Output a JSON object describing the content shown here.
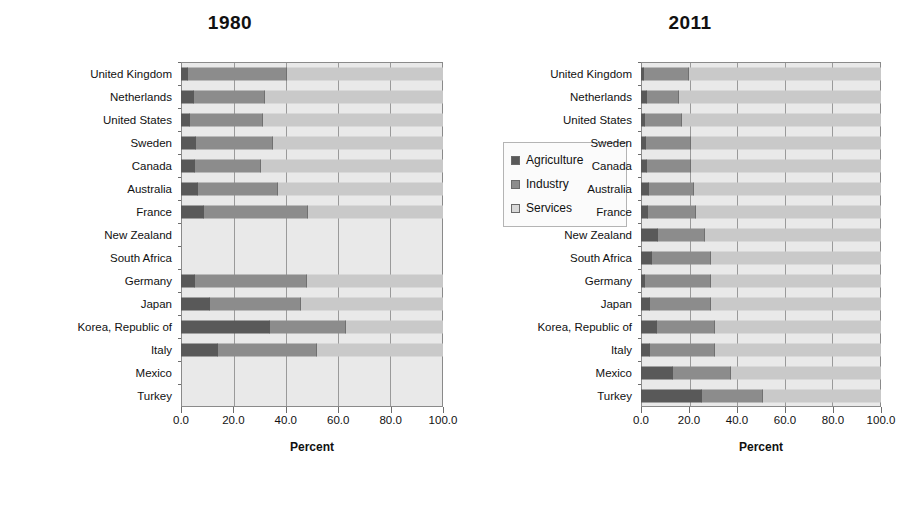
{
  "chart_data": [
    {
      "type": "bar",
      "orientation": "horizontal",
      "stacked": true,
      "percent_stacked": true,
      "title": "1980",
      "xlabel": "Percent",
      "ylabel": "",
      "xlim": [
        0,
        100
      ],
      "xticks": [
        "0.0",
        "20.0",
        "40.0",
        "60.0",
        "80.0",
        "100.0"
      ],
      "grid": true,
      "legend_position": "upper right inside plot",
      "legend": [
        "Agriculture",
        "Industry",
        "Services"
      ],
      "categories": [
        "United Kingdom",
        "Netherlands",
        "United States",
        "Sweden",
        "Canada",
        "Australia",
        "France",
        "New Zealand",
        "South Africa",
        "Germany",
        "Japan",
        "Korea, Republic of",
        "Italy",
        "Mexico",
        "Turkey"
      ],
      "series": [
        {
          "name": "Agriculture",
          "values": [
            2.6,
            5.1,
            3.4,
            5.6,
            5.4,
            6.5,
            8.6,
            null,
            null,
            5.2,
            10.9,
            34.0,
            14.2,
            null,
            null
          ]
        },
        {
          "name": "Industry",
          "values": [
            38.0,
            26.8,
            28.0,
            29.6,
            25.1,
            30.7,
            40.0,
            null,
            null,
            43.0,
            35.0,
            29.0,
            37.6,
            null,
            null
          ]
        },
        {
          "name": "Services",
          "values": [
            59.4,
            68.1,
            68.6,
            64.8,
            69.5,
            62.8,
            51.4,
            null,
            null,
            51.8,
            54.1,
            37.0,
            48.2,
            null,
            null
          ]
        }
      ]
    },
    {
      "type": "bar",
      "orientation": "horizontal",
      "stacked": true,
      "percent_stacked": true,
      "title": "2011",
      "xlabel": "Percent",
      "ylabel": "",
      "xlim": [
        0,
        100
      ],
      "xticks": [
        "0.0",
        "20.0",
        "40.0",
        "60.0",
        "80.0",
        "100.0"
      ],
      "grid": true,
      "legend_position": "upper right inside plot",
      "legend": [
        "Agriculture",
        "Industry",
        "Services"
      ],
      "categories": [
        "United Kingdom",
        "Netherlands",
        "United States",
        "Sweden",
        "Canada",
        "Australia",
        "France",
        "New Zealand",
        "South Africa",
        "Germany",
        "Japan",
        "Korea, Republic of",
        "Italy",
        "Mexico",
        "Turkey"
      ],
      "series": [
        {
          "name": "Agriculture",
          "values": [
            1.2,
            2.6,
            1.6,
            2.1,
            2.4,
            3.3,
            2.9,
            6.9,
            4.6,
            1.6,
            3.7,
            6.6,
            3.8,
            13.4,
            25.5
          ]
        },
        {
          "name": "Industry",
          "values": [
            18.8,
            13.4,
            15.6,
            18.9,
            18.6,
            18.7,
            20.1,
            19.6,
            24.4,
            27.4,
            25.3,
            24.4,
            27.2,
            24.1,
            25.5
          ]
        },
        {
          "name": "Services",
          "values": [
            80.0,
            84.0,
            82.8,
            79.0,
            79.0,
            78.0,
            77.0,
            73.5,
            71.0,
            71.0,
            71.0,
            69.0,
            69.0,
            62.5,
            49.0
          ]
        }
      ]
    }
  ],
  "panels": [
    {
      "title": "1980",
      "xaxis_title": "Percent"
    },
    {
      "title": "2011",
      "xaxis_title": "Percent"
    }
  ],
  "legend": {
    "agriculture": "Agriculture",
    "industry": "Industry",
    "services": "Services"
  },
  "colors": {
    "agriculture": "#595959",
    "industry": "#8c8c8c",
    "services": "#c9c9c9",
    "plot_background": "#e9e9e9",
    "axis": "#6d6d6d"
  }
}
